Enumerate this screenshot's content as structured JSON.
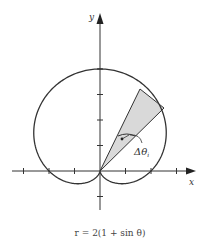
{
  "figure": {
    "x_axis_label": "x",
    "y_axis_label": "y",
    "angle_label": "Δθ",
    "angle_subscript": "i",
    "caption": "r = 2(1 + sin θ)"
  },
  "chart_data": {
    "type": "polar-curve",
    "equation": "r = 2(1 + sin θ)",
    "curve": "cardioid",
    "x_ticks": [
      -3,
      -2,
      -1,
      1,
      2,
      3
    ],
    "y_ticks": [
      -1,
      1,
      2,
      3,
      4
    ],
    "shaded_sector": {
      "theta_start_deg": 45,
      "theta_end_deg": 64,
      "r": 3.55,
      "label": "Δθ_i"
    },
    "grid": false
  },
  "colors": {
    "curve": "#333333",
    "axes": "#333333",
    "sector_fill": "#d9d9d9"
  }
}
